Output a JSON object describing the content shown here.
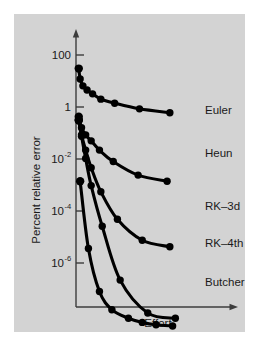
{
  "chart_data": {
    "type": "line",
    "title": "",
    "subtitle": "",
    "xlabel": "Effort",
    "ylabel": "Percent relative error",
    "yscale": "log",
    "xscale": "linear",
    "grid": false,
    "legend_position": "right-inline-labels",
    "axis_style": "arrow-ended L-frame",
    "ytick_labels": [
      "100",
      "1",
      "10",
      "10",
      "10"
    ],
    "ytick_exponents": [
      "",
      "",
      "-2",
      "-4",
      "-6"
    ],
    "ytick_values": [
      100,
      1,
      0.01,
      0.0001,
      1e-06
    ],
    "ylim": [
      2e-08,
      1000
    ],
    "xlim": [
      0,
      100
    ],
    "xtick_labels": [],
    "series": [
      {
        "name": "Euler",
        "label": "Euler",
        "x": [
          2,
          3,
          5,
          8,
          12,
          18,
          28,
          46,
          68
        ],
        "y": [
          30,
          12,
          6.5,
          4.5,
          3.2,
          2.0,
          1.4,
          0.85,
          0.6
        ]
      },
      {
        "name": "Heun",
        "label": "Heun",
        "x": [
          2,
          4,
          7,
          11,
          17,
          27,
          45,
          66
        ],
        "y": [
          0.42,
          0.16,
          0.085,
          0.05,
          0.022,
          0.008,
          0.0024,
          0.0014
        ]
      },
      {
        "name": "RK-3d",
        "label": "RK–3d",
        "x": [
          2,
          4,
          7,
          11,
          18,
          30,
          48,
          68
        ],
        "y": [
          0.32,
          0.085,
          0.022,
          0.0046,
          0.00055,
          4.8e-05,
          7.5e-06,
          4.2e-06
        ]
      },
      {
        "name": "RK-4th",
        "label": "RK–4th",
        "x": [
          2,
          4,
          7,
          11,
          19,
          32,
          52,
          72
        ],
        "y": [
          0.3,
          0.075,
          0.0105,
          0.00095,
          2.6e-05,
          2.2e-07,
          1.2e-08,
          7.5e-09
        ]
      },
      {
        "name": "Butcher",
        "label": "Butcher",
        "x": [
          3,
          9,
          17,
          26,
          38,
          48,
          58,
          70
        ],
        "y": [
          0.0014,
          3.6e-06,
          8e-08,
          1.6e-08,
          7.5e-09,
          5.2e-09,
          4.2e-09,
          3.8e-09
        ]
      }
    ]
  }
}
